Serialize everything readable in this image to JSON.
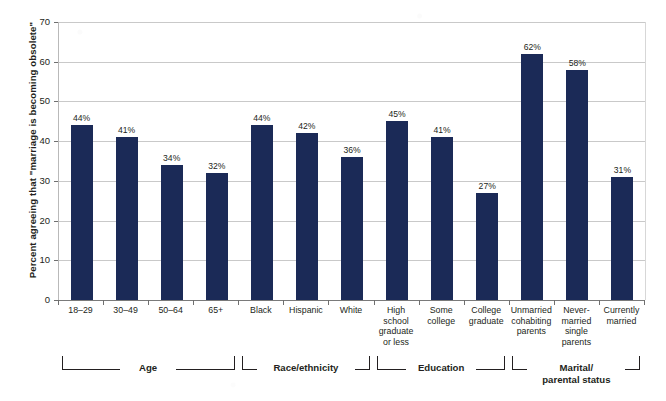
{
  "chart_data": {
    "type": "bar",
    "title": "",
    "subtitle": "",
    "xlabel": "",
    "ylabel": "Percent agreeing that \"marriage is becoming obsolete\"",
    "ylim": [
      0,
      70
    ],
    "ytick_values": [
      0,
      10,
      20,
      30,
      40,
      50,
      60,
      70
    ],
    "ytick_labels": [
      "0",
      "10",
      "20",
      "30",
      "40",
      "50",
      "60",
      "70"
    ],
    "grid": "horizontal",
    "legend": "none",
    "bar_color": "#1b2a57",
    "value_label_suffix": "%",
    "categories": [
      "18–29",
      "30–49",
      "50–64",
      "65+",
      "Black",
      "Hispanic",
      "White",
      "High\nschool\ngraduate\nor less",
      "Some\ncollege",
      "College\ngraduate",
      "Unmarried\ncohabiting\nparents",
      "Never-\nmarried\nsingle\nparents",
      "Currently\nmarried"
    ],
    "values": [
      44,
      41,
      34,
      32,
      44,
      42,
      36,
      45,
      41,
      27,
      62,
      58,
      31
    ],
    "value_labels": [
      "44%",
      "41%",
      "34%",
      "32%",
      "44%",
      "42%",
      "36%",
      "45%",
      "41%",
      "27%",
      "62%",
      "58%",
      "31%"
    ],
    "groups": [
      {
        "label": "Age",
        "first": 0,
        "last": 3
      },
      {
        "label": "Race/ethnicity",
        "first": 4,
        "last": 6
      },
      {
        "label": "Education",
        "first": 7,
        "last": 9
      },
      {
        "label": "Marital/\nparental status",
        "first": 10,
        "last": 12
      }
    ]
  }
}
